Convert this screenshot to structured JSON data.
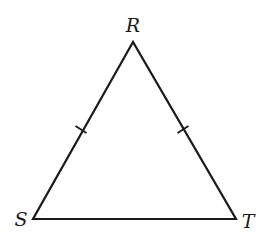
{
  "diagram": {
    "type": "isosceles-triangle",
    "vertices": [
      {
        "label": "R",
        "x": 133,
        "y": 42
      },
      {
        "label": "S",
        "x": 33,
        "y": 219
      },
      {
        "label": "T",
        "x": 236,
        "y": 219
      }
    ],
    "congruent_sides": [
      "RS",
      "RT"
    ],
    "tick_marks": 1,
    "stroke_color": "#1a1a1a",
    "background": "#ffffff"
  },
  "labels": {
    "R": "R",
    "S": "S",
    "T": "T"
  }
}
